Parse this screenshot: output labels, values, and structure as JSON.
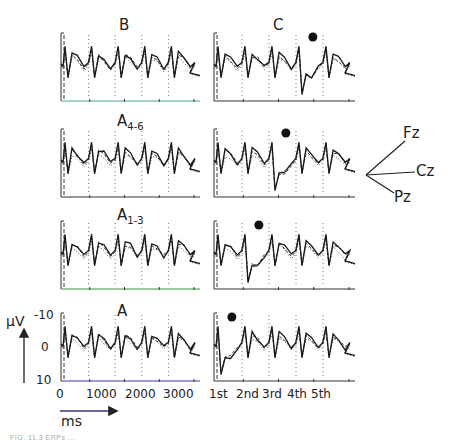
{
  "figure": {
    "caption": "FIG. 11.3 ERPs ...",
    "y_unit": "µV",
    "x_unit": "ms",
    "y_ticks": [
      "-10",
      "0",
      "10"
    ],
    "x_ticks_left": [
      "0",
      "1000",
      "2000",
      "3000"
    ],
    "x_ticks_right": [
      "1st",
      "2nd",
      "3rd",
      "4th",
      "5th"
    ],
    "electrode_legend": {
      "labels": [
        "Fz",
        "Cz",
        "Pz"
      ],
      "styles": {
        "Fz": "solid",
        "Cz": "dashed",
        "Pz": "dotted"
      }
    },
    "marker": "filled-circle (onset of deviant)"
  },
  "panels": [
    {
      "id": "B",
      "title": "B",
      "sub": "",
      "row": 1
    },
    {
      "id": "C",
      "title": "C",
      "sub": "",
      "row": 1
    },
    {
      "id": "A4-6",
      "title": "A",
      "sub": "4-6",
      "row": 2
    },
    {
      "id": "A1-3",
      "title": "A",
      "sub": "1-3",
      "row": 3
    },
    {
      "id": "A",
      "title": "A",
      "sub": "",
      "row": 4
    }
  ],
  "chart_data": [
    {
      "type": "line",
      "title": "ERP waveforms by condition (B, C, A4-6, A1-3, A)",
      "xlabel": "ms",
      "ylabel": "µV (negative up)",
      "ylim": [
        10,
        -10
      ],
      "x_ticks": [
        0,
        1000,
        2000,
        3000
      ],
      "x_ticks_right_columns": [
        "1st",
        "2nd",
        "3rd",
        "4th",
        "5th"
      ],
      "legend": [
        "Fz (solid)",
        "Cz (dashed)",
        "Pz (dotted)"
      ],
      "grid": "vertical dotted lines at stimulus onsets",
      "columns": [
        "standard sequence (left)",
        "deviant sequence with marker (right)"
      ],
      "rows": [
        "B / C",
        "A4-6",
        "A1-3",
        "A"
      ],
      "deviant_marker_position": {
        "C": "4th",
        "A4-6": "3rd",
        "A1-3": "2nd",
        "A": "1st"
      },
      "series": [
        {
          "name": "Fz",
          "style": "solid"
        },
        {
          "name": "Cz",
          "style": "dashed"
        },
        {
          "name": "Pz",
          "style": "dotted"
        }
      ]
    }
  ]
}
